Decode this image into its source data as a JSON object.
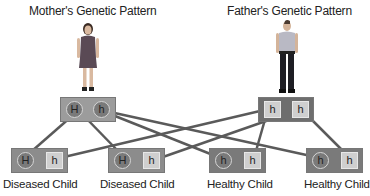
{
  "titles": {
    "mother": "Mother's Genetic Pattern",
    "father": "Father's Genetic Pattern"
  },
  "mother": {
    "alleles": [
      "H",
      "h"
    ],
    "shapes": [
      "circle",
      "circle"
    ]
  },
  "father": {
    "alleles": [
      "h",
      "h"
    ],
    "shapes": [
      "square",
      "square"
    ]
  },
  "children": [
    {
      "label": "Diseased Child",
      "alleles": [
        "H",
        "h"
      ]
    },
    {
      "label": "Diseased Child",
      "alleles": [
        "H",
        "h"
      ]
    },
    {
      "label": "Healthy Child",
      "alleles": [
        "h",
        "h"
      ]
    },
    {
      "label": "Healthy Child",
      "alleles": [
        "h",
        "h"
      ]
    }
  ],
  "colors": {
    "line": "#5a5a5a",
    "box_dark": "#6e6e6e",
    "box_light": "#9c9c9c"
  }
}
